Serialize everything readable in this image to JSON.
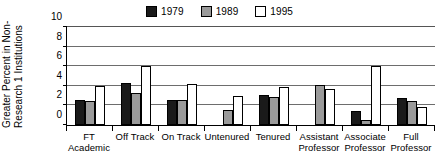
{
  "chart_data": {
    "type": "bar",
    "title": "",
    "xlabel": "",
    "ylabel": "Greater Percent in Non-Research 1 Institutions",
    "ylabel_lines": [
      "Greater Percent in Non-",
      "Research 1 Institutions"
    ],
    "ylim": [
      0,
      10
    ],
    "yticks": [
      0,
      2,
      4,
      6,
      8,
      10
    ],
    "ytick_labels": [
      "0",
      "2",
      "4",
      "6",
      "8",
      "10"
    ],
    "grid": true,
    "legend_position": "top-center",
    "categories": [
      "FT Academic",
      "Off Track",
      "On Track",
      "Untenured",
      "Tenured",
      "Assistant Professor",
      "Associate Professor",
      "Full Professor"
    ],
    "category_lines": [
      [
        "FT",
        "Academic"
      ],
      [
        "Off Track",
        ""
      ],
      [
        "On Track",
        ""
      ],
      [
        "Untenured",
        ""
      ],
      [
        "Tenured",
        ""
      ],
      [
        "Assistant",
        "Professor"
      ],
      [
        "Associate",
        "Professor"
      ],
      [
        "Full",
        "Professor"
      ]
    ],
    "series": [
      {
        "name": "1979",
        "color": "#1a1a1a",
        "values": [
          2.6,
          4.3,
          2.6,
          0,
          3.1,
          0,
          1.4,
          2.8
        ]
      },
      {
        "name": "1989",
        "color": "#9a9a9a",
        "values": [
          2.4,
          3.3,
          2.6,
          1.5,
          2.9,
          4.1,
          0.5,
          2.5
        ]
      },
      {
        "name": "1995",
        "color": "#ffffff",
        "values": [
          4.0,
          6.0,
          4.2,
          3.0,
          3.9,
          3.7,
          6.0,
          1.8
        ]
      }
    ]
  },
  "legend": {
    "entries": [
      {
        "label": "1979",
        "color": "#1a1a1a"
      },
      {
        "label": "1989",
        "color": "#9a9a9a"
      },
      {
        "label": "1995",
        "color": "#ffffff"
      }
    ]
  }
}
